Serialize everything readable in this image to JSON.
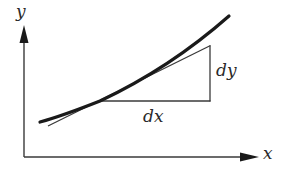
{
  "diagram": {
    "axes": {
      "x_label": "x",
      "y_label": "y",
      "origin": [
        24,
        157
      ],
      "x_axis_end": [
        258,
        157
      ],
      "y_axis_end": [
        24,
        26
      ]
    },
    "curve": {
      "description": "convex increasing curve (thick)",
      "path": "M 40 122 Q 62 116 100 101 Q 170 68 229 16",
      "stroke_width": 3.2
    },
    "tangent": {
      "description": "tangent line at point of tangency (thin)",
      "from": [
        48,
        126
      ],
      "to": [
        210,
        46
      ],
      "stroke_width": 1.3
    },
    "triangle": {
      "horizontal": {
        "from": [
          100,
          101
        ],
        "to": [
          210,
          101
        ]
      },
      "vertical": {
        "from": [
          210,
          46
        ],
        "to": [
          210,
          101
        ]
      },
      "dx_label": "dx",
      "dy_label": "dy"
    },
    "colors": {
      "stroke": "#1a1a1a",
      "thin_stroke": "#3a3a3a",
      "background": "#ffffff"
    }
  }
}
